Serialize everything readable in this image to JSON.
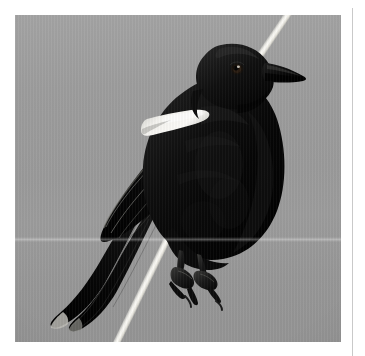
{
  "page": {
    "kind": "photographic-plate",
    "background_color": "#ffffff",
    "column_rule_color": "#c9c9c9"
  },
  "photo": {
    "subject": "blackbird perched on white stem",
    "subject_icon": "bird-icon",
    "orientation": "portrait",
    "frame": {
      "x": 15,
      "y": 15,
      "width": 326,
      "height": 327
    },
    "sky_color": "#9a9a9a",
    "bird_color": "#0b0b0b",
    "stem_color": "#f7f6f1",
    "epaulet_color": "#f2f2ef",
    "alt_text": "A black bird with a white shoulder patch perched on a pale diagonal stem against a plain grey sky"
  }
}
